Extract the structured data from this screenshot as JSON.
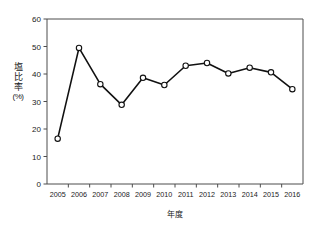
{
  "chart_data": {
    "type": "line",
    "title": "",
    "xlabel": "年度",
    "ylabel": "塩比率（%）",
    "ylabel_chars": [
      "塩",
      "比",
      "率"
    ],
    "ylabel_unit": "(%)",
    "categories": [
      "2005",
      "2006",
      "2007",
      "2008",
      "2009",
      "2010",
      "2011",
      "2012",
      "2013",
      "2014",
      "2015",
      "2016"
    ],
    "values": [
      16.5,
      49.5,
      36.3,
      28.8,
      38.6,
      36.0,
      43.0,
      44.0,
      40.2,
      42.3,
      40.6,
      34.5
    ],
    "series": [
      {
        "name": "塩比率",
        "values": [
          16.5,
          49.5,
          36.3,
          28.8,
          38.6,
          36.0,
          43.0,
          44.0,
          40.2,
          42.3,
          40.6,
          34.5
        ]
      }
    ],
    "ylim": [
      0,
      60
    ],
    "yticks": [
      0,
      10,
      20,
      30,
      40,
      50,
      60
    ],
    "ytick_labels": [
      "0",
      "10",
      "20",
      "30",
      "40",
      "50",
      "60"
    ],
    "grid": false,
    "legend": false,
    "marker": "open-circle",
    "line_color": "#111111",
    "marker_fill": "#ffffff",
    "axis_color": "#4d4d4d"
  }
}
